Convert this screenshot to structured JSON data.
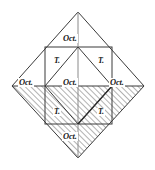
{
  "figure": {
    "labels": {
      "oct": "Oct.",
      "tet": "T."
    },
    "colors": {
      "stroke": "#3a3a3a",
      "hatch": "#555555",
      "background": "#ffffff",
      "text": "#1a1a1a"
    },
    "geometry": {
      "diamond": {
        "top": [
          78,
          12
        ],
        "right": [
          144,
          86
        ],
        "bottom": [
          78,
          158
        ],
        "left": [
          12,
          86
        ]
      },
      "inner_square": {
        "left": 45,
        "top": 47,
        "right": 112,
        "bottom": 124
      },
      "midline_y": 86,
      "center_x": 78,
      "hatched_region": "lower-half-of-diamond"
    },
    "annotations": [
      {
        "id": "oct-top",
        "text": "Oct.",
        "x": 78,
        "y": 39,
        "role": "octahedral-site"
      },
      {
        "id": "oct-left",
        "text": "Oct.",
        "x": 33,
        "y": 83,
        "role": "octahedral-site"
      },
      {
        "id": "oct-center",
        "text": "Oct.",
        "x": 78,
        "y": 83,
        "role": "octahedral-site"
      },
      {
        "id": "oct-right",
        "text": "Oct.",
        "x": 124,
        "y": 83,
        "role": "octahedral-site"
      },
      {
        "id": "oct-bottom",
        "text": "Oct.",
        "x": 78,
        "y": 137,
        "role": "octahedral-site"
      },
      {
        "id": "tet-top-left",
        "text": "T.",
        "x": 57,
        "y": 62,
        "role": "tetrahedral-site"
      },
      {
        "id": "tet-top-right",
        "text": "T.",
        "x": 100,
        "y": 62,
        "role": "tetrahedral-site"
      },
      {
        "id": "tet-bottom-left",
        "text": "T.",
        "x": 57,
        "y": 113,
        "role": "tetrahedral-site"
      },
      {
        "id": "tet-bottom-right",
        "text": "T.",
        "x": 100,
        "y": 113,
        "role": "tetrahedral-site"
      }
    ]
  }
}
